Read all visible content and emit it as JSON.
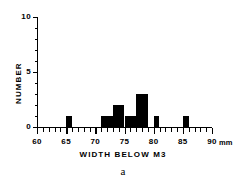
{
  "chart_data": {
    "type": "bar",
    "title": "",
    "subtitle": "",
    "caption": "a",
    "xlabel": "WIDTH BELOW M3",
    "ylabel": "NUMBER",
    "xunit": "mm",
    "bin_width": 1,
    "categories": [
      65,
      71,
      72,
      73,
      74,
      75,
      76,
      77,
      78,
      80,
      85
    ],
    "values": [
      1,
      1,
      1,
      2,
      2,
      1,
      1,
      3,
      3,
      1,
      1
    ],
    "xlim": [
      60,
      90
    ],
    "ylim": [
      0,
      10
    ],
    "xticks": [
      60,
      65,
      70,
      75,
      80,
      85,
      90
    ],
    "xticklabels": [
      "60",
      "65",
      "70",
      "75",
      "80",
      "85",
      "90"
    ],
    "xminor_step": 1,
    "yticks": [
      0,
      5,
      10
    ],
    "yticklabels": [
      "0",
      "5",
      "10"
    ],
    "yminor_step": 1,
    "grid": false,
    "legend": null,
    "bar_color": "#000000",
    "axis_color": "#000000"
  }
}
